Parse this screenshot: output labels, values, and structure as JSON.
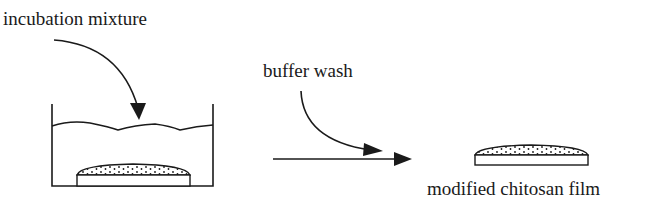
{
  "diagram": {
    "labels": {
      "incubation": "incubation mixture",
      "buffer": "buffer wash",
      "result": "modified chitosan film"
    },
    "colors": {
      "stroke": "#1a1a1a",
      "background": "#ffffff"
    },
    "elements": [
      "beaker-with-liquid",
      "chitosan-film-in-beaker",
      "incubation-arrow",
      "buffer-wash-arrow",
      "process-arrow",
      "modified-chitosan-film"
    ]
  }
}
